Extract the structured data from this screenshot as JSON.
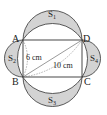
{
  "diagram": {
    "type": "geometry",
    "vertices": {
      "A": "A",
      "B": "B",
      "C": "C",
      "D": "D"
    },
    "regions": {
      "s1": "S",
      "s1_sub": "1",
      "s2": "S",
      "s2_sub": "2",
      "s3": "S",
      "s3_sub": "3",
      "s4": "S",
      "s4_sub": "4"
    },
    "measurements": {
      "side_ab": "6 cm",
      "diagonal_bd": "10 cm"
    },
    "colors": {
      "shade": "#d3d3d3",
      "stroke": "#333333",
      "background": "#ffffff"
    }
  }
}
